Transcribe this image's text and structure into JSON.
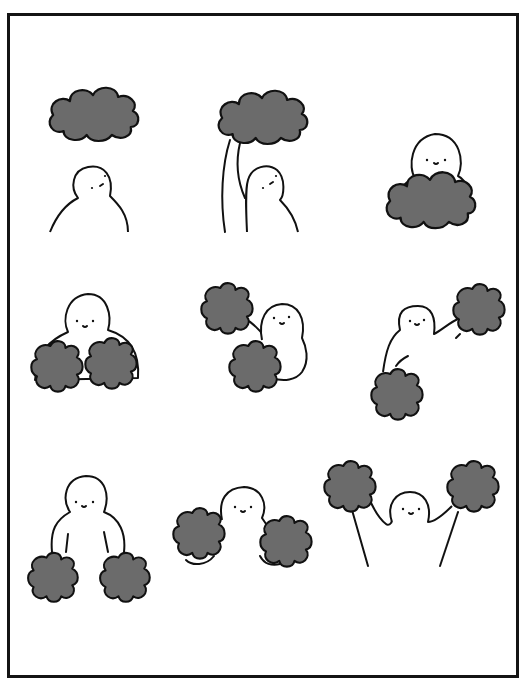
{
  "comic": {
    "title": "",
    "layout": "3x3 grid of wordless panels inside a single black border",
    "colors": {
      "background": "#ffffff",
      "border": "#141414",
      "ink": "#111111",
      "cloud_fill": "#6b6b6b"
    },
    "panels": [
      {
        "index": 1,
        "description": "Small round blob character looks up at a gray cloud floating above it"
      },
      {
        "index": 2,
        "description": "Character reaches up with one long arm and grabs the cloud"
      },
      {
        "index": 3,
        "description": "Character hugs the cloud against its body"
      },
      {
        "index": 4,
        "description": "Character has pulled the cloud into two pom-pom halves, one in each hand"
      },
      {
        "index": 5,
        "description": "Character swings one pom-pom up and one down"
      },
      {
        "index": 6,
        "description": "Character raises one pom-pom high, the other low"
      },
      {
        "index": 7,
        "description": "Character holds both pom-poms down at its sides"
      },
      {
        "index": 8,
        "description": "Character holds both pom-poms out to its sides"
      },
      {
        "index": 9,
        "description": "Character cheers with both pom-poms raised high on long arms"
      }
    ]
  }
}
